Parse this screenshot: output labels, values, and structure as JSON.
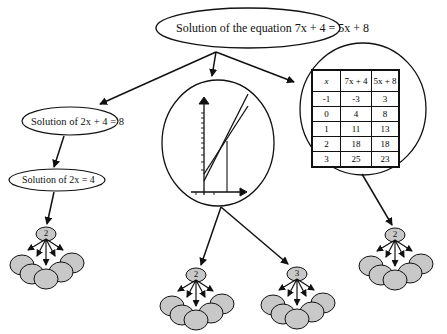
{
  "diagram": {
    "root": {
      "label": "Solution of the equation 7x + 4 = 5x + 8"
    },
    "branches": {
      "algebraic": {
        "step1": "Solution of 2x + 4 = 8",
        "step2": "Solution of  2x = 4",
        "cluster_badge": "2"
      },
      "graphical": {
        "description": "Graph of two lines y = 7x + 4 and y = 5x + 8 intersecting at x = 2",
        "clusters": [
          {
            "badge": "2"
          },
          {
            "badge": "3"
          }
        ]
      },
      "tabular": {
        "table": {
          "headers": [
            "x",
            "7x + 4",
            "5x + 8"
          ],
          "rows": [
            [
              "-1",
              "-3",
              "3"
            ],
            [
              "0",
              "4",
              "8"
            ],
            [
              "1",
              "11",
              "13"
            ],
            [
              "2",
              "18",
              "18"
            ],
            [
              "3",
              "25",
              "23"
            ]
          ]
        },
        "cluster_badge": "2"
      }
    },
    "colors": {
      "stroke": "#111111",
      "cluster_fill": "#c8c8c8",
      "background": "#ffffff"
    }
  }
}
